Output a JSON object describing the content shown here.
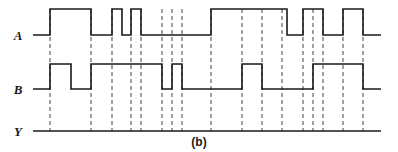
{
  "figure": {
    "caption": "(b)",
    "type": "digital-timing-diagram",
    "width": 398,
    "height": 152,
    "line_color": "#1a1a1a",
    "marker_color": "#555555",
    "background": "#ffffff"
  },
  "signals": [
    {
      "name": "A",
      "label": "A",
      "row_index": 0,
      "low_y": 35,
      "high_y": 9
    },
    {
      "name": "B",
      "label": "B",
      "row_index": 1,
      "low_y": 89,
      "high_y": 64
    },
    {
      "name": "Y",
      "label": "Y",
      "row_index": 2,
      "low_y": 131,
      "high_y": 131
    }
  ],
  "axis": {
    "x_start": 33,
    "x_end": 381,
    "marker_top": 9,
    "marker_bottom": 131
  },
  "chart_data": {
    "type": "line",
    "title": "(b)",
    "xlabel": "",
    "ylabel": "",
    "xlim": [
      33,
      381
    ],
    "ylim": [
      0,
      1
    ],
    "grid": false,
    "legend": "none",
    "series": [
      {
        "name": "A",
        "transitions": [
          50,
          91,
          112,
          122,
          131,
          141,
          211,
          287,
          303,
          323,
          343,
          363
        ],
        "initial_level": 0,
        "levels": [
          0,
          1,
          0,
          1,
          0,
          1,
          0,
          1,
          0,
          1,
          0,
          1,
          0
        ]
      },
      {
        "name": "B",
        "transitions": [
          50,
          71,
          91,
          162,
          172,
          182,
          242,
          262,
          313,
          363
        ],
        "initial_level": 0,
        "levels": [
          0,
          1,
          0,
          1,
          0,
          1,
          0,
          1,
          0,
          1,
          0
        ]
      },
      {
        "name": "Y",
        "transitions": [],
        "initial_level": 0,
        "levels": [
          0
        ]
      }
    ],
    "markers": [
      50,
      91,
      112,
      131,
      141,
      162,
      172,
      182,
      211,
      242,
      262,
      282,
      303,
      313,
      323,
      343,
      363
    ]
  }
}
